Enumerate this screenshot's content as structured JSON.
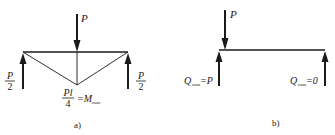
{
  "diagram_a": {
    "load_label": "P",
    "left_reaction": {
      "num": "P",
      "den": "2"
    },
    "right_reaction": {
      "num": "P",
      "den": "2"
    },
    "moment": {
      "num": "Pl",
      "den": "4",
      "eq": "=M",
      "sub": "max"
    },
    "caption": "a)"
  },
  "diagram_b": {
    "load_label": "P",
    "left_reaction": {
      "sym": "Q",
      "sub": "max",
      "eq": "=P"
    },
    "right_reaction": {
      "sym": "Q",
      "sub": "max",
      "eq": "=0"
    },
    "caption": "b)"
  },
  "colors": {
    "line": "#1a1a1a",
    "background": "#ffffff"
  }
}
